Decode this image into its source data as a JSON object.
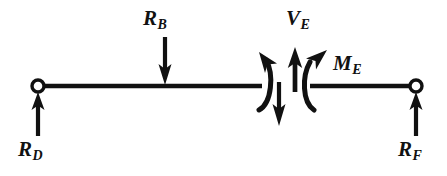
{
  "figure": {
    "type": "free-body-diagram",
    "background_color": "#ffffff",
    "ink_color": "#111111",
    "width": 447,
    "height": 176
  },
  "beam": {
    "label": "beam",
    "y": 86,
    "left_segment": {
      "x_start": 38,
      "x_end": 262
    },
    "right_segment": {
      "x_start": 310,
      "x_end": 416
    },
    "cut_gap": {
      "x_start": 262,
      "x_end": 310,
      "section_name": "E"
    }
  },
  "supports": [
    {
      "name": "support-D",
      "marker": "open-circle",
      "x": 38,
      "y": 86,
      "radius": 6
    },
    {
      "name": "support-F",
      "marker": "open-circle",
      "x": 416,
      "y": 86,
      "radius": 6
    }
  ],
  "forces": [
    {
      "id": "RD",
      "symbol": "R",
      "subscript": "D",
      "label": "R_D",
      "direction": "up",
      "kind": "reaction",
      "arrow": {
        "x": 38,
        "y_tail": 135,
        "y_head": 93
      }
    },
    {
      "id": "RB",
      "symbol": "R",
      "subscript": "B",
      "label": "R_B",
      "direction": "down",
      "kind": "applied-load",
      "arrow": {
        "x": 165,
        "y_tail": 37,
        "y_head": 84
      }
    },
    {
      "id": "VE",
      "symbol": "V",
      "subscript": "E",
      "label": "V_E",
      "direction": "up",
      "kind": "internal-shear",
      "arrow": {
        "x": 295,
        "y_tail": 90,
        "y_head": 50
      }
    },
    {
      "id": "VE-left",
      "symbol": "V",
      "subscript": "E",
      "label": "V_E",
      "direction": "down",
      "kind": "internal-shear-conjugate",
      "arrow": {
        "x": 279,
        "y_tail": 82,
        "y_head": 124
      }
    },
    {
      "id": "RF",
      "symbol": "R",
      "subscript": "F",
      "label": "R_F",
      "direction": "up",
      "kind": "reaction",
      "arrow": {
        "x": 416,
        "y_tail": 135,
        "y_head": 93
      }
    }
  ],
  "moments": [
    {
      "id": "ME-left",
      "symbol": "M",
      "subscript": "E",
      "label": "M_E",
      "sense": "counterclockwise",
      "kind": "internal-moment-conjugate",
      "side": "left-of-cut"
    },
    {
      "id": "ME-right",
      "symbol": "M",
      "subscript": "E",
      "label": "M_E",
      "sense": "clockwise",
      "kind": "internal-moment",
      "side": "right-of-cut"
    }
  ],
  "labels": {
    "RD": {
      "symbol": "R",
      "subscript": "D"
    },
    "RB": {
      "symbol": "R",
      "subscript": "B"
    },
    "VE": {
      "symbol": "V",
      "subscript": "E"
    },
    "ME": {
      "symbol": "M",
      "subscript": "E"
    },
    "RF": {
      "symbol": "R",
      "subscript": "F"
    }
  }
}
